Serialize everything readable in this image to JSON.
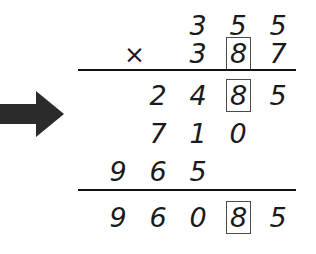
{
  "canvas": {
    "width": 316,
    "height": 254,
    "background_color": "#ffffff",
    "ink_color": "#1a1a1a",
    "box_outline_color": "#4a4a4a"
  },
  "arrow": {
    "icon": "arrow-right-icon",
    "direction": "right",
    "color": "#2b2b2b"
  },
  "problem": {
    "operation_symbol": "×",
    "multiplicand": "355",
    "multiplier": "387",
    "partial_products": [
      "2485",
      "710",
      "965"
    ],
    "answer": "96085",
    "highlighted_digit": "8",
    "rows": [
      {
        "name": "multiplicand",
        "digits": [
          {
            "value": "3",
            "boxed": false
          },
          {
            "value": "5",
            "boxed": false
          },
          {
            "value": "5",
            "boxed": false
          }
        ]
      },
      {
        "name": "multiplier",
        "operator": "×",
        "digits": [
          {
            "value": "3",
            "boxed": false
          },
          {
            "value": "8",
            "boxed": true
          },
          {
            "value": "7",
            "boxed": false
          }
        ]
      },
      {
        "name": "partial-product-1",
        "digits": [
          {
            "value": "2",
            "boxed": false
          },
          {
            "value": "4",
            "boxed": false
          },
          {
            "value": "8",
            "boxed": true
          },
          {
            "value": "5",
            "boxed": false
          }
        ]
      },
      {
        "name": "partial-product-2",
        "digits": [
          {
            "value": "7",
            "boxed": false
          },
          {
            "value": "1",
            "boxed": false
          },
          {
            "value": "0",
            "boxed": false
          }
        ]
      },
      {
        "name": "partial-product-3",
        "digits": [
          {
            "value": "9",
            "boxed": false
          },
          {
            "value": "6",
            "boxed": false
          },
          {
            "value": "5",
            "boxed": false
          }
        ]
      },
      {
        "name": "answer",
        "digits": [
          {
            "value": "9",
            "boxed": false
          },
          {
            "value": "6",
            "boxed": false
          },
          {
            "value": "0",
            "boxed": false
          },
          {
            "value": "8",
            "boxed": true
          },
          {
            "value": "5",
            "boxed": false
          }
        ]
      }
    ],
    "rules": [
      {
        "name": "multiplier-rule",
        "y": 70,
        "x1": 78,
        "x2": 296
      },
      {
        "name": "sum-rule",
        "y": 190,
        "x1": 78,
        "x2": 296
      }
    ]
  }
}
